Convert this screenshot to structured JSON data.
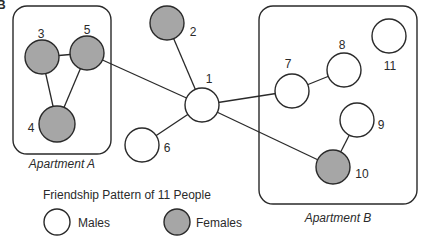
{
  "panel_letter": "B",
  "colors": {
    "male_fill": "#ffffff",
    "female_fill": "#a6a6a6",
    "stroke": "#2a2a2a"
  },
  "title": "Friendship Pattern of 11 People",
  "legend": {
    "males_label": "Males",
    "females_label": "Females"
  },
  "groups": [
    {
      "id": "A",
      "label": "Apartment A",
      "x": 13,
      "y": 6,
      "w": 98,
      "h": 148,
      "rx": 14,
      "label_x": 62,
      "label_y": 168
    },
    {
      "id": "B",
      "label": "Apartment B",
      "x": 259,
      "y": 6,
      "w": 158,
      "h": 198,
      "rx": 14,
      "label_x": 338,
      "label_y": 222
    }
  ],
  "nodes": [
    {
      "id": "1",
      "label": "1",
      "sex": "male",
      "cx": 202,
      "cy": 105,
      "r": 17,
      "lx": 209,
      "ly": 83
    },
    {
      "id": "2",
      "label": "2",
      "sex": "female",
      "cx": 167,
      "cy": 23,
      "r": 17,
      "lx": 193,
      "ly": 36
    },
    {
      "id": "3",
      "label": "3",
      "sex": "female",
      "cx": 42,
      "cy": 57,
      "r": 17,
      "lx": 41,
      "ly": 38
    },
    {
      "id": "4",
      "label": "4",
      "sex": "female",
      "cx": 57,
      "cy": 124,
      "r": 18,
      "lx": 31,
      "ly": 132
    },
    {
      "id": "5",
      "label": "5",
      "sex": "female",
      "cx": 87,
      "cy": 53,
      "r": 17,
      "lx": 87,
      "ly": 34
    },
    {
      "id": "6",
      "label": "6",
      "sex": "male",
      "cx": 142,
      "cy": 145,
      "r": 17,
      "lx": 167,
      "ly": 152
    },
    {
      "id": "7",
      "label": "7",
      "sex": "male",
      "cx": 292,
      "cy": 91,
      "r": 17,
      "lx": 288,
      "ly": 68
    },
    {
      "id": "8",
      "label": "8",
      "sex": "male",
      "cx": 344,
      "cy": 70,
      "r": 17,
      "lx": 342,
      "ly": 49
    },
    {
      "id": "9",
      "label": "9",
      "sex": "male",
      "cx": 357,
      "cy": 120,
      "r": 17,
      "lx": 381,
      "ly": 129
    },
    {
      "id": "10",
      "label": "10",
      "sex": "female",
      "cx": 333,
      "cy": 167,
      "r": 17,
      "lx": 362,
      "ly": 178
    },
    {
      "id": "11",
      "label": "11",
      "sex": "male",
      "cx": 389,
      "cy": 36,
      "r": 17,
      "lx": 390,
      "ly": 70
    }
  ],
  "edges": [
    [
      "3",
      "5"
    ],
    [
      "3",
      "4"
    ],
    [
      "5",
      "4"
    ],
    [
      "5",
      "1"
    ],
    [
      "2",
      "1"
    ],
    [
      "1",
      "6"
    ],
    [
      "1",
      "7"
    ],
    [
      "1",
      "10"
    ],
    [
      "7",
      "8"
    ],
    [
      "9",
      "10"
    ]
  ]
}
